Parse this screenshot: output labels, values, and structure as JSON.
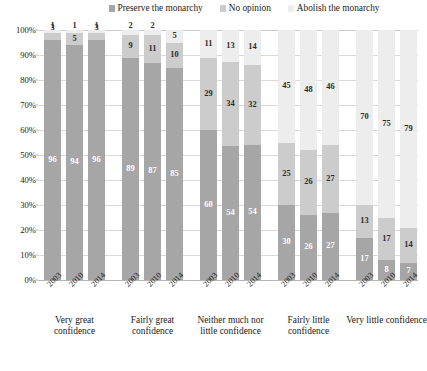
{
  "chart_data": {
    "type": "bar",
    "stacked": true,
    "title": "",
    "xlabel": "",
    "ylabel": "",
    "ylim": [
      0,
      100
    ],
    "ytick_labels": [
      "100%",
      "90%",
      "80%",
      "70%",
      "60%",
      "50%",
      "40%",
      "30%",
      "20%",
      "10%",
      "0%"
    ],
    "ytick_values": [
      100,
      90,
      80,
      70,
      60,
      50,
      40,
      30,
      20,
      10,
      0
    ],
    "grid": true,
    "legend_position": "top",
    "legend": [
      "Preserve the monarchy",
      "No opinion",
      "Abolish the monarchy"
    ],
    "colors": {
      "preserve": "#a6a6a6",
      "no_opinion": "#cccccc",
      "abolish": "#ededed"
    },
    "groups": [
      {
        "category": "Very great confidence",
        "years": [
          "2003",
          "2010",
          "2014"
        ],
        "preserve": [
          96,
          94,
          96
        ],
        "no_opinion": [
          3,
          5,
          3
        ],
        "abolish": [
          1,
          1,
          1
        ]
      },
      {
        "category": "Fairly great confidence",
        "years": [
          "2003",
          "2010",
          "2014"
        ],
        "preserve": [
          89,
          87,
          85
        ],
        "no_opinion": [
          9,
          11,
          10
        ],
        "abolish": [
          2,
          2,
          5
        ]
      },
      {
        "category": "Neither much nor little confidence",
        "years": [
          "2003",
          "2010",
          "2014"
        ],
        "preserve": [
          60,
          54,
          54
        ],
        "no_opinion": [
          29,
          34,
          32
        ],
        "abolish": [
          11,
          13,
          14
        ]
      },
      {
        "category": "Fairly little confidence",
        "years": [
          "2003",
          "2010",
          "2014"
        ],
        "preserve": [
          30,
          26,
          27
        ],
        "no_opinion": [
          25,
          26,
          27
        ],
        "abolish": [
          45,
          48,
          46
        ]
      },
      {
        "category": "Very little confidence",
        "years": [
          "2003",
          "2010",
          "2014"
        ],
        "preserve": [
          17,
          8,
          7
        ],
        "no_opinion": [
          13,
          17,
          14
        ],
        "abolish": [
          70,
          75,
          79
        ]
      }
    ]
  },
  "caption": ""
}
